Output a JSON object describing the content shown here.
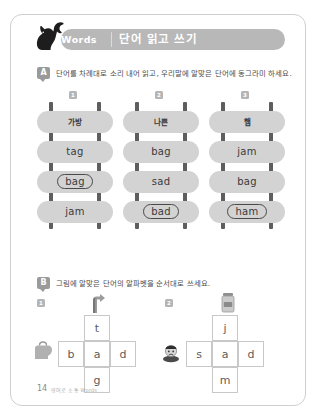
{
  "header": {
    "words_label": "Words",
    "korean_title": "단어 읽고 쓰기",
    "cat_icon": "cat-silhouette-icon",
    "bar_color": "#b8b8b8"
  },
  "sections": {
    "a": {
      "badge": "A",
      "instruction": "단어를 차례대로 소리 내어 읽고, 우리말에 알맞은 단어에 동그라미 하세요."
    },
    "b": {
      "badge": "B",
      "instruction": "그림에 알맞은 단어의 알파벳을 순서대로 쓰세요."
    }
  },
  "ladders": [
    {
      "number": "1",
      "korean": "가방",
      "rungs": [
        {
          "text": "tag",
          "circled": false
        },
        {
          "text": "bag",
          "circled": true
        },
        {
          "text": "jam",
          "circled": false
        }
      ]
    },
    {
      "number": "2",
      "korean": "나쁜",
      "rungs": [
        {
          "text": "bag",
          "circled": false
        },
        {
          "text": "sad",
          "circled": false
        },
        {
          "text": "bad",
          "circled": true
        }
      ]
    },
    {
      "number": "3",
      "korean": "햄",
      "rungs": [
        {
          "text": "jam",
          "circled": false
        },
        {
          "text": "bag",
          "circled": false
        },
        {
          "text": "ham",
          "circled": true
        }
      ]
    }
  ],
  "puzzles": [
    {
      "number": "1",
      "top_letter": "t",
      "middle_letters": [
        "b",
        "a",
        "d"
      ],
      "bottom_letter": "g",
      "top_picture": "hand-pointing-icon",
      "side_picture": "bag-icon"
    },
    {
      "number": "2",
      "top_letter": "j",
      "middle_letters": [
        "s",
        "a",
        "d"
      ],
      "bottom_letter": "m",
      "top_picture": "jam-jar-icon",
      "side_picture": "sad-face-icon"
    }
  ],
  "footer": {
    "page_number": "14",
    "label": "영어로 소통 Words"
  }
}
